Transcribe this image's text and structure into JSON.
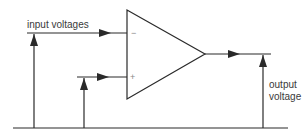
{
  "diagram": {
    "type": "op-amp schematic",
    "labels": {
      "input": "input voltages",
      "output_line1": "output",
      "output_line2": "voltage"
    },
    "terminals": {
      "inverting": "−",
      "non_inverting": "+"
    },
    "colors": {
      "line": "#2a2a2a",
      "background": "#ffffff"
    }
  }
}
